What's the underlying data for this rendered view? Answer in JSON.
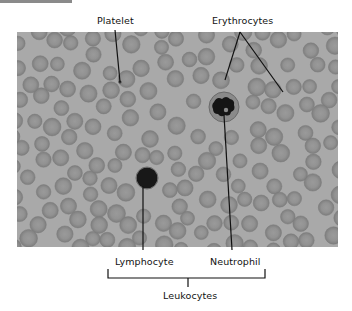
{
  "figure": {
    "labels": {
      "platelet": "Platelet",
      "erythrocytes": "Erythrocytes",
      "lymphocyte": "Lymphocyte",
      "neutrophil": "Neutrophil",
      "leukocytes": "Leukocytes"
    },
    "colors": {
      "background": "#a9a9a9",
      "cell_fill": "#8c8c8c",
      "cell_center": "#999999",
      "nucleus": "#151515",
      "line": "#111111"
    },
    "micrograph": {
      "x": 17,
      "y": 32,
      "width": 321,
      "height": 215
    },
    "lymphocyte": {
      "cx": 147,
      "cy": 178,
      "r": 10
    },
    "neutrophil": {
      "cx": 224,
      "cy": 107,
      "r": 15
    },
    "platelet": {
      "cx": 120,
      "cy": 82,
      "r": 1.5
    }
  }
}
